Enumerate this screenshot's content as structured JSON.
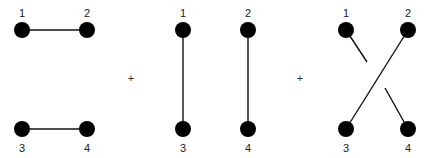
{
  "diagram": {
    "operators": [
      "+",
      "+"
    ],
    "colors": {
      "node": "#000000",
      "edge": "#111111",
      "background": "#ffffff"
    },
    "panels": [
      {
        "name": "horizontal-pairing",
        "nodes": [
          {
            "label": "1",
            "x": 22,
            "y": 30,
            "label_pos": "above"
          },
          {
            "label": "2",
            "x": 87,
            "y": 30,
            "label_pos": "above"
          },
          {
            "label": "3",
            "x": 22,
            "y": 129,
            "label_pos": "below"
          },
          {
            "label": "4",
            "x": 87,
            "y": 129,
            "label_pos": "below"
          }
        ],
        "edges": [
          [
            "1",
            "2"
          ],
          [
            "3",
            "4"
          ]
        ]
      },
      {
        "name": "vertical-pairing",
        "nodes": [
          {
            "label": "1",
            "x": 183,
            "y": 30,
            "label_pos": "above"
          },
          {
            "label": "2",
            "x": 248,
            "y": 30,
            "label_pos": "above"
          },
          {
            "label": "3",
            "x": 183,
            "y": 129,
            "label_pos": "below"
          },
          {
            "label": "4",
            "x": 248,
            "y": 129,
            "label_pos": "below"
          }
        ],
        "edges": [
          [
            "1",
            "3"
          ],
          [
            "2",
            "4"
          ]
        ]
      },
      {
        "name": "crossed-pairing",
        "nodes": [
          {
            "label": "1",
            "x": 346,
            "y": 30,
            "label_pos": "above"
          },
          {
            "label": "2",
            "x": 408,
            "y": 30,
            "label_pos": "above"
          },
          {
            "label": "3",
            "x": 346,
            "y": 129,
            "label_pos": "below"
          },
          {
            "label": "4",
            "x": 408,
            "y": 129,
            "label_pos": "below"
          }
        ],
        "edges": [
          [
            "1",
            "4",
            "broken-under"
          ],
          [
            "2",
            "3"
          ]
        ]
      }
    ]
  }
}
